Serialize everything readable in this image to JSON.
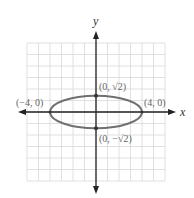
{
  "diagram": {
    "type": "ellipse-graph",
    "axes": {
      "x_label": "x",
      "y_label": "y"
    },
    "grid": {
      "x_min": -6,
      "x_max": 6,
      "y_min": -6,
      "y_max": 6,
      "step": 1
    },
    "ellipse": {
      "center": [
        0,
        0
      ],
      "a": 4,
      "b": 1.414,
      "stroke": "#707070"
    },
    "points": [
      {
        "label": "(−4, 0)",
        "x": -4,
        "y": 0
      },
      {
        "label": "(4, 0)",
        "x": 4,
        "y": 0
      },
      {
        "label": "(0, √2)",
        "x": 0,
        "y": 1.414
      },
      {
        "label": "(0, −√2)",
        "x": 0,
        "y": -1.414
      }
    ],
    "colors": {
      "grid": "#d8d8d8",
      "axis": "#222222",
      "ellipse": "#707070",
      "point": "#333333",
      "label": "#666666"
    }
  }
}
